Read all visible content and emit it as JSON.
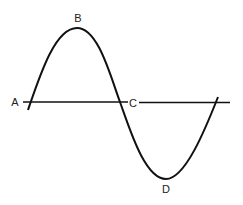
{
  "diagram": {
    "type": "sine-wave",
    "colors": {
      "stroke": "#111111",
      "label": "#222222",
      "background": "#ffffff"
    },
    "axis": {
      "y": 102,
      "x_start": 23,
      "x_end": 230,
      "gap_start": 128,
      "gap_end": 139
    },
    "points": [
      {
        "id": "A",
        "label": "A",
        "role": "start crossing",
        "x": 31,
        "y": 102,
        "label_x": 15,
        "label_y": 106
      },
      {
        "id": "B",
        "label": "B",
        "role": "crest (maximum)",
        "x": 77,
        "y": 28,
        "label_x": 78,
        "label_y": 22
      },
      {
        "id": "C",
        "label": "C",
        "role": "zero crossing",
        "x": 120,
        "y": 102,
        "label_x": 133,
        "label_y": 107
      },
      {
        "id": "D",
        "label": "D",
        "role": "trough (minimum)",
        "x": 166,
        "y": 179,
        "label_x": 166,
        "label_y": 193
      }
    ]
  }
}
